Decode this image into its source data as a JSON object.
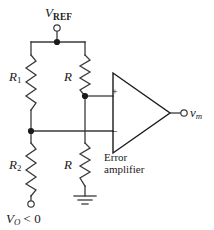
{
  "figure": {
    "type": "schematic",
    "background_color": "#ffffff",
    "wire_color": "#3a3a3a",
    "text_color": "#1a1a1a"
  },
  "labels": {
    "vref": {
      "symbol": "V",
      "subscript": "REF"
    },
    "r1": {
      "symbol": "R",
      "subscript": "1"
    },
    "r_top": {
      "symbol": "R",
      "subscript": ""
    },
    "r2": {
      "symbol": "R",
      "subscript": "2"
    },
    "r_bottom": {
      "symbol": "R",
      "subscript": ""
    },
    "vo": {
      "symbol": "V",
      "subscript": "O",
      "relation": " < 0"
    },
    "vm": {
      "symbol": "v",
      "subscript": "m"
    },
    "error_amplifier_line1": "Error",
    "error_amplifier_line2": "amplifier",
    "opamp_noninverting": "+",
    "opamp_inverting": "–"
  },
  "components": {
    "resistors": [
      {
        "name": "R1",
        "label": "R₁",
        "orientation": "vertical",
        "x": 31,
        "y_top": 55,
        "y_bottom": 110
      },
      {
        "name": "R_top",
        "label": "R",
        "orientation": "vertical",
        "x": 85,
        "y_top": 55,
        "y_bottom": 96
      },
      {
        "name": "R2",
        "label": "R₂",
        "orientation": "vertical",
        "x": 31,
        "y_top": 143,
        "y_bottom": 196
      },
      {
        "name": "R_bottom",
        "label": "R",
        "orientation": "vertical",
        "x": 85,
        "y_top": 143,
        "y_bottom": 186
      }
    ],
    "terminals": [
      {
        "name": "vref-terminal",
        "x": 57,
        "y": 27
      },
      {
        "name": "vo-terminal",
        "x": 31,
        "y": 204
      },
      {
        "name": "vm-terminal",
        "x": 185,
        "y": 113
      }
    ],
    "nodes": [
      {
        "name": "vref-node",
        "x": 57,
        "y": 42
      },
      {
        "name": "divider-node",
        "x": 31,
        "y": 131
      },
      {
        "name": "noninverting-node",
        "x": 85,
        "y": 96
      }
    ],
    "ground": {
      "name": "ground-symbol",
      "x": 85,
      "y": 196
    },
    "opamp": {
      "name": "error-amplifier",
      "apex_x": 170,
      "apex_y": 113,
      "left_x": 113,
      "top_y": 73,
      "bottom_y": 153
    }
  }
}
